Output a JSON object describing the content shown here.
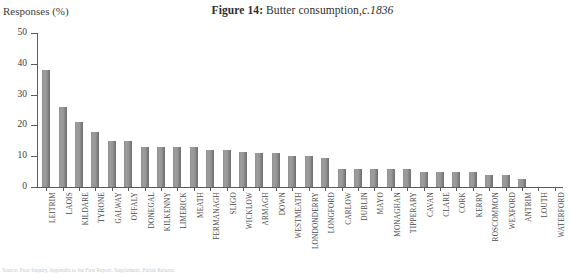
{
  "title": {
    "label": "Figure 14:",
    "caption": "Butter consumption,",
    "circa": "c.1836"
  },
  "y_axis_title": "Responses (%)",
  "source_note": "Source: Poor Inquiry, Appendix to the First Report, Supplement, Parish Returns",
  "chart_data": {
    "type": "bar",
    "xlabel": "",
    "ylabel": "Responses (%)",
    "ylim": [
      0,
      50
    ],
    "yticks": [
      0,
      10,
      20,
      30,
      40,
      50
    ],
    "grid": false,
    "legend": null,
    "bar_color": "#8f8f8f",
    "categories": [
      "LEITRIM",
      "LAOIS",
      "KILDARE",
      "TYRONE",
      "GALWAY",
      "OFFALY",
      "DONEGAL",
      "KILKENNY",
      "LIMERICK",
      "MEATH",
      "FERMANAGH",
      "SLIGO",
      "WICKLOW",
      "ARMAGH",
      "DOWN",
      "WESTMEATH",
      "LONDONDERRY",
      "LONGFORD",
      "CARLOW",
      "DUBLIN",
      "MAYO",
      "MONAGHAN",
      "TIPPERARY",
      "CAVAN",
      "CLARE",
      "CORK",
      "KERRY",
      "ROSCOMMON",
      "WEXFORD",
      "ANTRIM",
      "LOUTH",
      "WATERFORD"
    ],
    "values": [
      38,
      26,
      21,
      18,
      15,
      15,
      13,
      13,
      13,
      13,
      12,
      12,
      11.5,
      11,
      11,
      10,
      10,
      9.5,
      6,
      6,
      6,
      6,
      6,
      5,
      5,
      5,
      5,
      4,
      4,
      2.5,
      0,
      0
    ]
  }
}
